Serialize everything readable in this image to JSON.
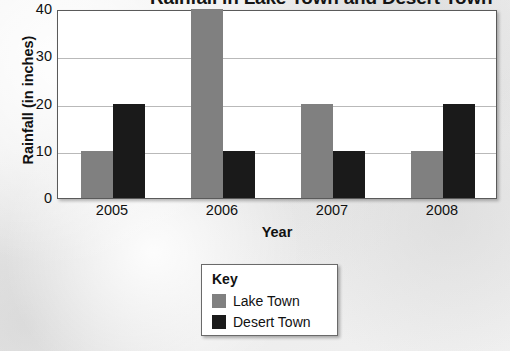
{
  "chart_data": {
    "type": "bar",
    "title": "Rainfall in Lake Town and Desert Town",
    "title_note": "title is cropped by the top edge of the screenshot; only \"Town and Desert Town\" is legible",
    "xlabel": "Year",
    "ylabel": "Rainfall (in inches)",
    "categories": [
      "2005",
      "2006",
      "2007",
      "2008"
    ],
    "series": [
      {
        "name": "Lake Town",
        "color": "#808080",
        "values": [
          10,
          40,
          20,
          10
        ]
      },
      {
        "name": "Desert Town",
        "color": "#1a1a1a",
        "values": [
          20,
          10,
          10,
          20
        ]
      }
    ],
    "ylim": [
      0,
      40
    ],
    "yticks": [
      0,
      10,
      20,
      30,
      40
    ],
    "ytick_labels": [
      "0",
      "10",
      "20",
      "30",
      "40"
    ],
    "grid": true,
    "grid_axis": "y",
    "legend_position": "bottom-center",
    "legend_title": "Key"
  },
  "colors": {
    "lake_town": "#808080",
    "desert_town": "#1a1a1a",
    "plot_background": "#ffffff",
    "page_background": "#efefef",
    "gridline": "#b9b9b9",
    "axis_border": "#5a5a5a",
    "text": "#111111"
  }
}
